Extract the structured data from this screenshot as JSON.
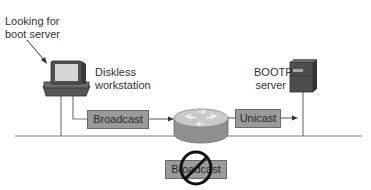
{
  "diagram": {
    "annotation": {
      "line1": "Looking for",
      "line2": "boot server"
    },
    "workstation": {
      "line1": "Diskless",
      "line2": "workstation",
      "icon": "desktop-computer-icon"
    },
    "server": {
      "line1": "BOOTP",
      "line2": "server",
      "icon": "server-tower-icon"
    },
    "router": {
      "icon": "router-icon"
    },
    "packets": {
      "broadcast": "Broadcast",
      "unicast": "Unicast",
      "blocked_broadcast": "Broadcast"
    },
    "blocked_symbol": "prohibited-icon",
    "colors": {
      "packet_fill": "#9a9a9a",
      "packet_border": "#6a6a6a",
      "line": "#7a7a7a",
      "device_dark": "#4a4a4a"
    }
  }
}
